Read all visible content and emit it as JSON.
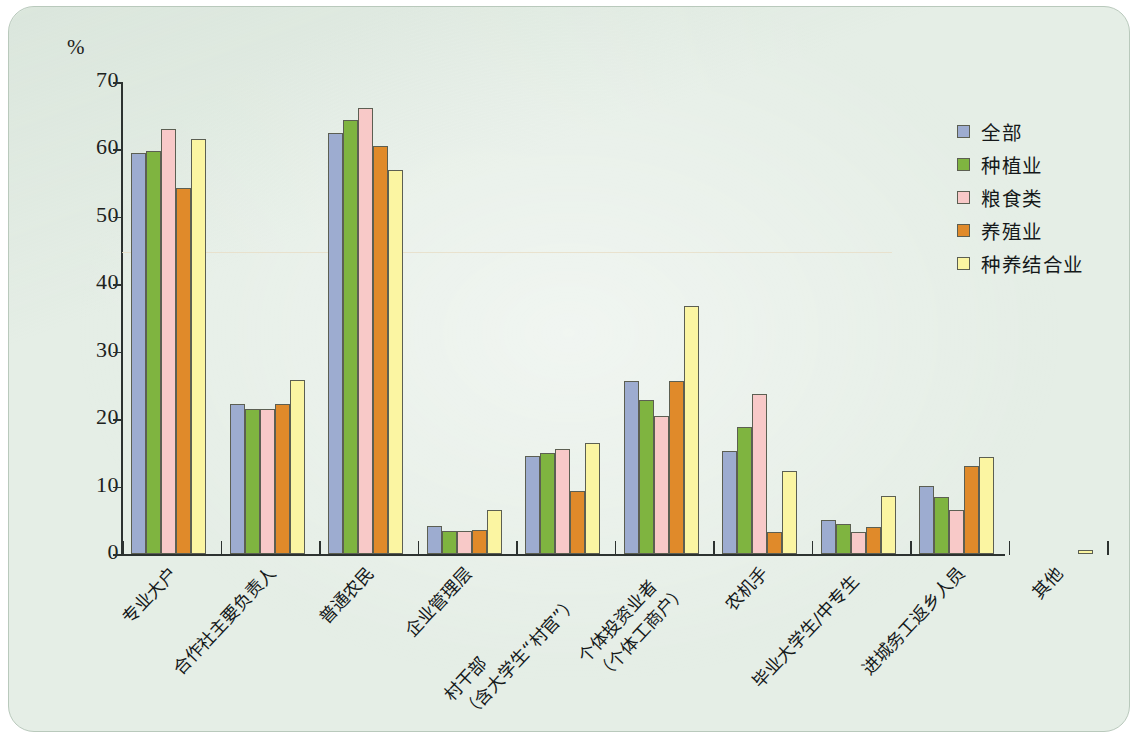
{
  "figure": {
    "background_color": "#e5eee6",
    "axis_color": "#2c3230",
    "y_unit": "%"
  },
  "legend": {
    "position": "top-right",
    "entries": [
      {
        "label": "全部",
        "color": "#9dacd0"
      },
      {
        "label": "种植业",
        "color": "#7fb440"
      },
      {
        "label": "粮食类",
        "color": "#f8c9c8"
      },
      {
        "label": "养殖业",
        "color": "#e08a2a"
      },
      {
        "label": "种养结合业",
        "color": "#fbf5a2"
      }
    ]
  },
  "chart_data": {
    "type": "bar",
    "title": "",
    "xlabel": "",
    "ylabel": "%",
    "ylim": [
      0,
      70
    ],
    "yticks": [
      0,
      10,
      20,
      30,
      40,
      50,
      60,
      70
    ],
    "grid": false,
    "legend_position": "top-right",
    "categories": [
      "专业大户",
      "合作社主要负责人",
      "普通农民",
      "企业管理层",
      "村干部（含大学生“村官”）",
      "个体投资业者（个体工商户）",
      "农机手",
      "毕业大学生/中专生",
      "进城务工返乡人员",
      "其他"
    ],
    "category_lines": [
      [
        "专业大户"
      ],
      [
        "合作社主要负责人"
      ],
      [
        "普通农民"
      ],
      [
        "企业管理层"
      ],
      [
        "村干部",
        "（含大学生“村官”）"
      ],
      [
        "个体投资业者",
        "（个体工商户）"
      ],
      [
        "农机手"
      ],
      [
        "毕业大学生/中专生"
      ],
      [
        "进城务工返乡人员"
      ],
      [
        "其他"
      ]
    ],
    "series": [
      {
        "name": "全部",
        "color": "#9dacd0",
        "values": [
          59.4,
          22.3,
          62.4,
          4.1,
          14.5,
          25.6,
          15.3,
          5.0,
          10.1,
          0.0
        ]
      },
      {
        "name": "种植业",
        "color": "#7fb440",
        "values": [
          59.8,
          21.5,
          64.3,
          3.4,
          15.0,
          22.8,
          18.8,
          4.4,
          8.4,
          0.0
        ]
      },
      {
        "name": "粮食类",
        "color": "#f8c9c8",
        "values": [
          63.0,
          21.5,
          66.2,
          3.4,
          15.6,
          20.5,
          23.8,
          3.2,
          6.6,
          0.0
        ]
      },
      {
        "name": "养殖业",
        "color": "#e08a2a",
        "values": [
          54.3,
          22.3,
          60.5,
          3.6,
          9.3,
          25.7,
          3.2,
          4.0,
          13.0,
          0.0
        ]
      },
      {
        "name": "种养结合业",
        "color": "#fbf5a2",
        "values": [
          61.5,
          25.8,
          57.0,
          6.5,
          16.4,
          36.8,
          12.3,
          8.6,
          14.4,
          0.6
        ]
      }
    ]
  }
}
